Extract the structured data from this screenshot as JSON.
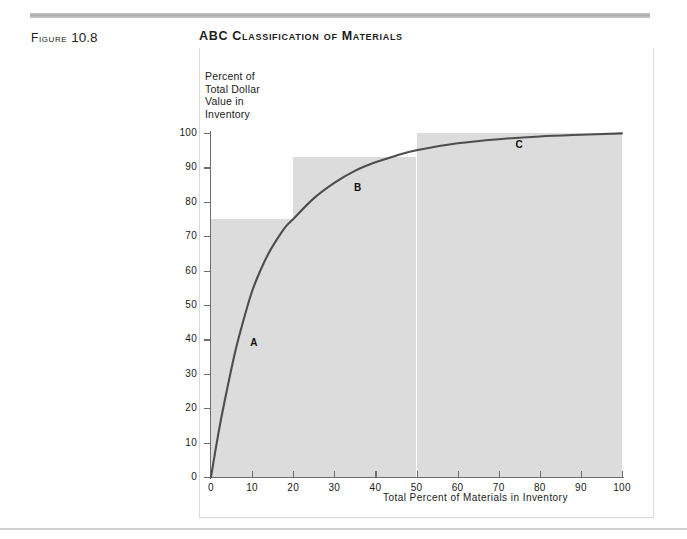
{
  "header": {
    "figure_label": "Figure",
    "figure_number": "10.8",
    "title": "ABC Classification of Materials"
  },
  "chart_data": {
    "type": "line",
    "title": "ABC Classification of Materials",
    "xlabel": "Total Percent of Materials in Inventory",
    "ylabel": "Percent of\nTotal Dollar\nValue in\nInventory",
    "ylabel_lines": [
      "Percent of",
      "Total Dollar",
      "Value in",
      "Inventory"
    ],
    "xlim": [
      0,
      100
    ],
    "ylim": [
      0,
      100
    ],
    "grid": false,
    "legend": "none",
    "xticks": [
      0,
      10,
      20,
      30,
      40,
      50,
      60,
      70,
      80,
      90,
      100
    ],
    "yticks": [
      0,
      10,
      20,
      30,
      40,
      50,
      60,
      70,
      80,
      90,
      100
    ],
    "series": [
      {
        "name": "Cumulative percent of total dollar value",
        "x": [
          0,
          2,
          4,
          6,
          8,
          10,
          12,
          14,
          16,
          18,
          20,
          25,
          30,
          35,
          40,
          45,
          50,
          60,
          70,
          80,
          90,
          100
        ],
        "y": [
          0,
          14,
          26,
          37,
          46,
          54,
          60,
          65,
          69,
          72.5,
          75,
          81,
          85.5,
          89,
          91.5,
          93.4,
          95,
          97,
          98.2,
          99,
          99.5,
          99.9
        ]
      }
    ],
    "regions": [
      {
        "label": "A",
        "x_start": 0,
        "x_end": 20,
        "y_top": 75,
        "label_x": 10.3,
        "label_y": 39
      },
      {
        "label": "B",
        "x_start": 20,
        "x_end": 50,
        "y_top": 93,
        "label_x": 35.5,
        "label_y": 84
      },
      {
        "label": "C",
        "x_start": 50,
        "x_end": 100,
        "y_top": 100,
        "label_x": 74.8,
        "label_y": 96.5
      }
    ],
    "colors": {
      "curve": "#4d4d4d",
      "shading": "#dcdcdc",
      "axis": "#6e6e6e",
      "text": "#1a1a1a",
      "rule": "#c3c3c3"
    }
  }
}
